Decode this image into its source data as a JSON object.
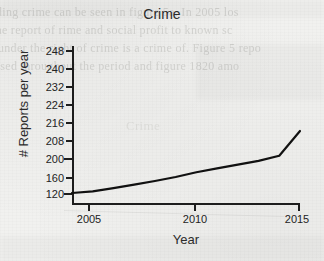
{
  "chart_data": {
    "type": "line",
    "title": "Crime",
    "xlabel": "Year",
    "ylabel": "# Reports per year",
    "x": [
      2004,
      2005,
      2006,
      2007,
      2008,
      2009,
      2010,
      2011,
      2012,
      2013,
      2014,
      2015
    ],
    "values": [
      120,
      124,
      132,
      141,
      150,
      160,
      170,
      178,
      186,
      194,
      201,
      212
    ],
    "series": [
      {
        "name": "Reports per year",
        "values": [
          120,
          124,
          132,
          141,
          150,
          160,
          170,
          178,
          186,
          194,
          201,
          212
        ]
      }
    ],
    "xticks": [
      "2005",
      "2010",
      "2015"
    ],
    "xtick_values": [
      2005,
      2010,
      2015
    ],
    "yticks": [
      "248",
      "240",
      "232",
      "224",
      "216",
      "208",
      "200",
      "160",
      "120"
    ],
    "ytick_values": [
      248,
      240,
      232,
      224,
      216,
      208,
      200,
      160,
      120
    ],
    "xlim": [
      2004,
      2015
    ],
    "ylim": [
      120,
      248
    ],
    "grid": false,
    "legend": false,
    "line_color": "#111111",
    "line_width": 2,
    "annotations": [
      "Line rises steadily from 2004 to 2014, then climbs sharply to 2015"
    ]
  },
  "page": {
    "background_color": "#f1f1ef",
    "showthrough": [
      "ding crime can be seen in figure 5a. In 2005 los",
      "the report of rime and social profit to known sc",
      "under the right of crime is a crime of. Figure 5 repo",
      "used throughout the period and figure 1820 amo",
      "Crime"
    ]
  }
}
